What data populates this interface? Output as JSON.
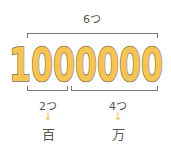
{
  "number": "1000000",
  "top": {
    "label": "6つ"
  },
  "groups": [
    {
      "count_label": "2つ",
      "arrow": "↓",
      "unit": "百"
    },
    {
      "count_label": "4つ",
      "arrow": "↓",
      "unit": "万"
    }
  ],
  "colors": {
    "digit_fill": "#F6C453",
    "digit_stroke": "#7a6a55",
    "bracket": "#777777",
    "arrow": "#F2C25A",
    "text": "#555555"
  }
}
